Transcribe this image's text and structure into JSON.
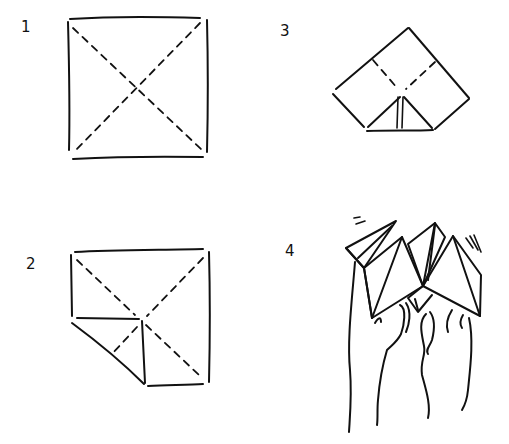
{
  "diagram": {
    "colors": {
      "ink": "#111111",
      "background": "#ffffff"
    },
    "steps": [
      {
        "number": "1",
        "description": "Square sheet with both diagonals creased (dashed)"
      },
      {
        "number": "2",
        "description": "Square with one corner folded into the center"
      },
      {
        "number": "3",
        "description": "Folded shape with dashed crease lines and corner flap"
      },
      {
        "number": "4",
        "description": "Finished fortune teller held on fingers"
      }
    ]
  }
}
